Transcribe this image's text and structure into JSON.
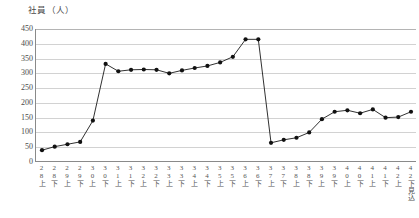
{
  "chart_data": {
    "type": "line",
    "title": "",
    "ylabel": "社員（人）",
    "xlabel": "",
    "ylim": [
      0,
      450
    ],
    "ytick_step": 50,
    "yticks": [
      0,
      50,
      100,
      150,
      200,
      250,
      300,
      350,
      400,
      450
    ],
    "grid": true,
    "legend": "none",
    "marker": "filled-circle",
    "line_color": "#1a1a1a",
    "categories": [
      "28上",
      "28下",
      "29上",
      "29下",
      "30上",
      "30下",
      "31上",
      "31下",
      "32上",
      "32下",
      "33上",
      "33下",
      "34上",
      "34下",
      "35上",
      "35下",
      "36上",
      "36下",
      "37上",
      "37下",
      "38上",
      "38下",
      "39上",
      "39下",
      "40上",
      "40下",
      "41上",
      "41下",
      "42上",
      "42下見込"
    ],
    "series": [
      {
        "name": "社員",
        "values": [
          40,
          52,
          60,
          68,
          140,
          332,
          307,
          312,
          313,
          312,
          300,
          310,
          318,
          325,
          337,
          356,
          415,
          415,
          65,
          75,
          82,
          100,
          145,
          170,
          175,
          165,
          178,
          150,
          152,
          170
        ]
      }
    ]
  }
}
